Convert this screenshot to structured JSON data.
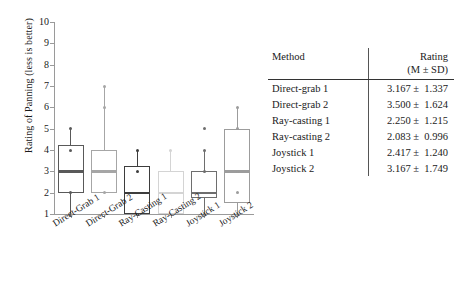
{
  "figure": {
    "y_axis_label": "Rating of Panning (less is better)"
  },
  "chart_data": {
    "type": "box",
    "title": "",
    "xlabel": "",
    "ylabel": "Rating of Panning (less is better)",
    "ylim": [
      1,
      10
    ],
    "yticks": [
      1,
      2,
      3,
      4,
      5,
      6,
      7,
      8,
      9,
      10
    ],
    "ytick_labels": [
      "1",
      "2",
      "3",
      "4",
      "5",
      "6",
      "7",
      "8",
      "9",
      "10"
    ],
    "grid": false,
    "legend": "none",
    "categories": [
      "Direct-Grab 1",
      "Direct-Grab 2",
      "Ray-Casting 1",
      "Ray-Casting 2",
      "Joystick 1",
      "Joystick 2"
    ],
    "boxes": [
      {
        "name": "Direct-Grab 1",
        "whisker_low": 1.0,
        "q1": 2.0,
        "median": 3.0,
        "q3": 4.25,
        "whisker_high": 5.0,
        "outliers": [],
        "points": [
          5.0,
          4.0,
          3.0,
          2.0,
          1.0
        ],
        "color": "#595959"
      },
      {
        "name": "Direct-Grab 2",
        "whisker_low": 2.0,
        "q1": 2.0,
        "median": 3.0,
        "q3": 4.0,
        "whisker_high": 7.0,
        "outliers": [],
        "points": [
          7.0,
          6.0,
          3.0,
          2.0
        ],
        "color": "#a6a6a6"
      },
      {
        "name": "Ray-Casting 1",
        "whisker_low": 1.0,
        "q1": 1.0,
        "median": 2.0,
        "q3": 3.25,
        "whisker_high": 4.0,
        "outliers": [],
        "points": [
          4.0,
          3.0,
          1.0
        ],
        "color": "#3d3d3d"
      },
      {
        "name": "Ray-Casting 2",
        "whisker_low": 1.0,
        "q1": 1.0,
        "median": 2.0,
        "q3": 3.0,
        "whisker_high": 4.0,
        "outliers": [],
        "points": [
          4.0,
          1.0
        ],
        "color": "#d4d4d4"
      },
      {
        "name": "Joystick 1",
        "whisker_low": 1.0,
        "q1": 1.75,
        "median": 2.0,
        "q3": 3.0,
        "whisker_high": 4.0,
        "outliers": [
          5.0
        ],
        "points": [
          4.0,
          3.0,
          1.0
        ],
        "color": "#6e6e6e"
      },
      {
        "name": "Joystick 2",
        "whisker_low": 1.0,
        "q1": 1.5,
        "median": 3.0,
        "q3": 5.0,
        "whisker_high": 6.0,
        "outliers": [],
        "points": [
          6.0,
          5.0,
          3.0,
          2.0,
          1.0
        ],
        "color": "#9c9c9c"
      }
    ]
  },
  "table": {
    "header": {
      "method": "Method",
      "rating": "Rating",
      "rating_sub": "(M ± SD)"
    },
    "rows": [
      {
        "method": "Direct-grab 1",
        "rating": "3.167 ±  1.337"
      },
      {
        "method": "Direct-grab 2",
        "rating": "3.500 ±  1.624"
      },
      {
        "method": "Ray-casting 1",
        "rating": "2.250 ±  1.215"
      },
      {
        "method": "Ray-casting 2",
        "rating": "2.083 ±  0.996"
      },
      {
        "method": "Joystick 1",
        "rating": "2.417 ±  1.240"
      },
      {
        "method": "Joystick 2",
        "rating": "3.167 ±  1.749"
      }
    ]
  }
}
